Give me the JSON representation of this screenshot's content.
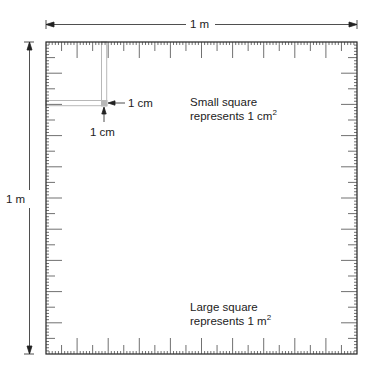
{
  "diagram": {
    "top_dimension": {
      "label": "1 m"
    },
    "left_dimension": {
      "label": "1 m"
    },
    "small_square": {
      "width_label": "1 cm",
      "height_label": "1 cm",
      "caption_line1": "Small square",
      "caption_line2_prefix": "represents 1 cm",
      "caption_line2_exponent": "2"
    },
    "large_square": {
      "caption_line1": "Large square",
      "caption_line2_prefix": "represents 1 m",
      "caption_line2_exponent": "2"
    },
    "ruler": {
      "divisions": 100,
      "major_every": 10,
      "mid_every": 5
    },
    "colors": {
      "line": "#222222",
      "highlight_strip": "#b8b8b8",
      "background": "#ffffff"
    }
  }
}
